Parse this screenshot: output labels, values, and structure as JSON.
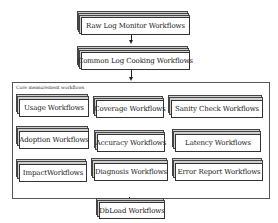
{
  "diagram": {
    "top_nodes": [
      {
        "label": "Raw Log Monitor Workflows"
      },
      {
        "label": "Common Log Cooking Workflows"
      }
    ],
    "group": {
      "label": "Core measurement workflows",
      "nodes": [
        {
          "label": "Usage Workflows"
        },
        {
          "label": "Coverage Workflows"
        },
        {
          "label": "Sanity Check Workflows"
        },
        {
          "label": "Adoption Workflows"
        },
        {
          "label": "Accuracy Workflows"
        },
        {
          "label": "Latency Workflows"
        },
        {
          "label": "ImpactWorkflows"
        },
        {
          "label": "Diagnosis Workflows"
        },
        {
          "label": "Error Report Workflows"
        }
      ]
    },
    "bottom_node": {
      "label": "DbLoad Workflows"
    },
    "edges": [
      {
        "from": "Raw Log Monitor Workflows",
        "to": "Common Log Cooking Workflows"
      },
      {
        "from": "Common Log Cooking Workflows",
        "to": "Core measurement workflows"
      },
      {
        "from": "Core measurement workflows",
        "to": "DbLoad Workflows"
      }
    ]
  }
}
